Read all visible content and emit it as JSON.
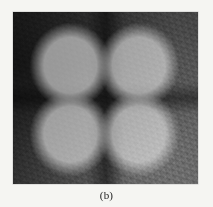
{
  "figure": {
    "caption": "(b)",
    "panel_label": "b",
    "image": {
      "alt_description": "Grayscale photographic image of a four-lobed clover-shaped intensity pattern on a dark grainy background",
      "pattern_name": "four-lobe-clover-pattern",
      "background_color": "#3f3f3f",
      "lobe_color": "#ffffff",
      "nodal_color": "#0a0a0a",
      "lobe_count": 4,
      "has_central_spot": true,
      "lobe_positions": [
        "upper-left",
        "upper-right",
        "lower-left",
        "lower-right"
      ]
    }
  },
  "page": {
    "background_color": "#f5f5f2",
    "text_color": "#1c1c1c"
  }
}
